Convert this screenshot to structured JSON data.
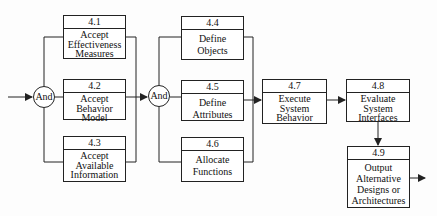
{
  "gates": [
    {
      "id": "and1",
      "label": "And"
    },
    {
      "id": "and2",
      "label": "And"
    }
  ],
  "boxes": [
    {
      "id": "4.1",
      "number": "4.1",
      "lines": [
        "Accept",
        "Effectiveness",
        "Measures"
      ]
    },
    {
      "id": "4.2",
      "number": "4.2",
      "lines": [
        "Accept",
        "Behavior",
        "Model"
      ]
    },
    {
      "id": "4.3",
      "number": "4.3",
      "lines": [
        "Accept",
        "Available",
        "Information"
      ]
    },
    {
      "id": "4.4",
      "number": "4.4",
      "lines": [
        "Define",
        "Objects"
      ]
    },
    {
      "id": "4.5",
      "number": "4.5",
      "lines": [
        "Define",
        "Attributes"
      ]
    },
    {
      "id": "4.6",
      "number": "4.6",
      "lines": [
        "Allocate",
        "Functions"
      ]
    },
    {
      "id": "4.7",
      "number": "4.7",
      "lines": [
        "Execute",
        "System",
        "Behavior"
      ]
    },
    {
      "id": "4.8",
      "number": "4.8",
      "lines": [
        "Evaluate",
        "System",
        "Interfaces"
      ]
    },
    {
      "id": "4.9",
      "number": "4.9",
      "lines": [
        "Output",
        "Alternative",
        "Designs or",
        "Architectures"
      ]
    }
  ],
  "colors": {
    "line": "#222222",
    "background": "#fdfdfd"
  }
}
